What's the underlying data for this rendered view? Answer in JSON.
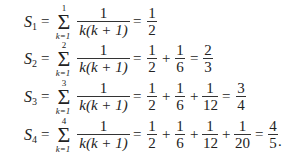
{
  "rows": [
    {
      "lhs_base": "S",
      "lhs_index": "1",
      "sum_upper": "1",
      "sum_lower": "k=1",
      "summand_num": "1",
      "summand_den": "k(k + 1)",
      "terms": [
        {
          "num": "1",
          "den": "2"
        }
      ],
      "result": null
    },
    {
      "lhs_base": "S",
      "lhs_index": "2",
      "sum_upper": "2",
      "sum_lower": "k=1",
      "summand_num": "1",
      "summand_den": "k(k + 1)",
      "terms": [
        {
          "num": "1",
          "den": "2"
        },
        {
          "num": "1",
          "den": "6"
        }
      ],
      "result": {
        "num": "2",
        "den": "3"
      }
    },
    {
      "lhs_base": "S",
      "lhs_index": "3",
      "sum_upper": "3",
      "sum_lower": "k=1",
      "summand_num": "1",
      "summand_den": "k(k + 1)",
      "terms": [
        {
          "num": "1",
          "den": "2"
        },
        {
          "num": "1",
          "den": "6"
        },
        {
          "num": "1",
          "den": "12"
        }
      ],
      "result": {
        "num": "3",
        "den": "4"
      }
    },
    {
      "lhs_base": "S",
      "lhs_index": "4",
      "sum_upper": "4",
      "sum_lower": "k=1",
      "summand_num": "1",
      "summand_den": "k(k + 1)",
      "terms": [
        {
          "num": "1",
          "den": "2"
        },
        {
          "num": "1",
          "den": "6"
        },
        {
          "num": "1",
          "den": "12"
        },
        {
          "num": "1",
          "den": "20"
        }
      ],
      "result": {
        "num": "4",
        "den": "5"
      },
      "trailing": "."
    }
  ],
  "symbols": {
    "equals": "=",
    "plus": "+",
    "sigma": "Σ"
  }
}
